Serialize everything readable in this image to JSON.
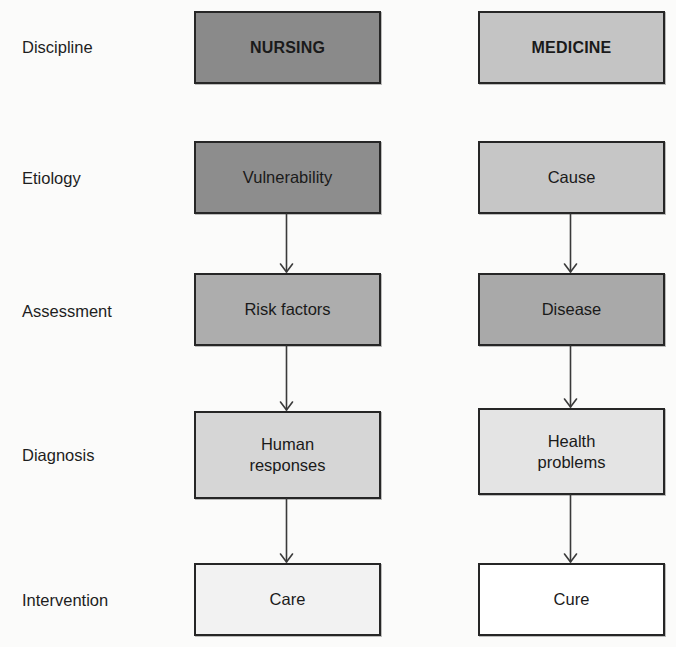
{
  "diagram": {
    "row_labels": [
      {
        "id": "discipline",
        "text": "Discipline"
      },
      {
        "id": "etiology",
        "text": "Etiology"
      },
      {
        "id": "assessment",
        "text": "Assessment"
      },
      {
        "id": "diagnosis",
        "text": "Diagnosis"
      },
      {
        "id": "intervention",
        "text": "Intervention"
      }
    ],
    "nursing": {
      "discipline": {
        "line1": "NURSING",
        "line2": ""
      },
      "etiology": {
        "line1": "Vulnerability",
        "line2": ""
      },
      "assessment": {
        "line1": "Risk factors",
        "line2": ""
      },
      "diagnosis": {
        "line1": "Human",
        "line2": "responses"
      },
      "intervention": {
        "line1": "Care",
        "line2": ""
      }
    },
    "medicine": {
      "discipline": {
        "line1": "MEDICINE",
        "line2": ""
      },
      "etiology": {
        "line1": "Cause",
        "line2": ""
      },
      "assessment": {
        "line1": "Disease",
        "line2": ""
      },
      "diagnosis": {
        "line1": "Health",
        "line2": "problems"
      },
      "intervention": {
        "line1": "Cure",
        "line2": ""
      }
    },
    "colors": {
      "nursing_discipline": "#8a8a8a",
      "nursing_etiology": "#8d8d8d",
      "nursing_assessment": "#adadad",
      "nursing_diagnosis": "#d6d6d6",
      "nursing_intervention": "#f2f2f2",
      "medicine_discipline": "#c4c4c4",
      "medicine_etiology": "#c6c6c6",
      "medicine_assessment": "#a9a9a9",
      "medicine_diagnosis": "#e4e4e4",
      "medicine_intervention": "#ffffff",
      "border": "#262626",
      "arrow": "#3a3a3a"
    },
    "flows": [
      {
        "column": "nursing",
        "from": "etiology",
        "to": "assessment"
      },
      {
        "column": "nursing",
        "from": "assessment",
        "to": "diagnosis"
      },
      {
        "column": "nursing",
        "from": "diagnosis",
        "to": "intervention"
      },
      {
        "column": "medicine",
        "from": "etiology",
        "to": "assessment"
      },
      {
        "column": "medicine",
        "from": "assessment",
        "to": "diagnosis"
      },
      {
        "column": "medicine",
        "from": "diagnosis",
        "to": "intervention"
      }
    ]
  }
}
